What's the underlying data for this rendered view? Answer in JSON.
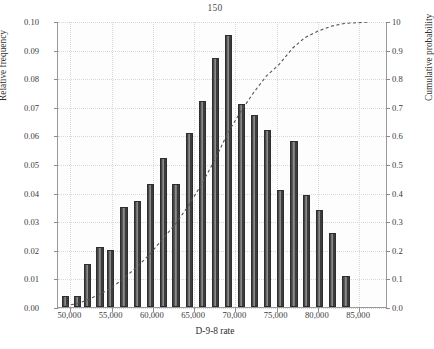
{
  "chart_data": {
    "type": "bar",
    "title": "150",
    "xlabel": "D-9-8 rate",
    "ylabel": "Relative frequency",
    "y2label": "Cumulative probability",
    "grid": true,
    "legend": "none",
    "xlim": [
      48500,
      88500
    ],
    "ylim": [
      0.0,
      0.1
    ],
    "y2lim": [
      0.0,
      1.0
    ],
    "ytick_labels": [
      "0.00",
      "0.01",
      "0.02",
      "0.03",
      "0.04",
      "0.05",
      "0.06",
      "0.07",
      "0.08",
      "0.09",
      "0.10"
    ],
    "ytick_values": [
      0.0,
      0.01,
      0.02,
      0.03,
      0.04,
      0.05,
      0.06,
      0.07,
      0.08,
      0.09,
      0.1
    ],
    "y2tick_labels": [
      "0.0",
      "0.1",
      "0.2",
      "0.3",
      "0.4",
      "0.5",
      "0.6",
      "0.7",
      "0.8",
      "0.9",
      "10"
    ],
    "y2tick_values": [
      0.0,
      0.1,
      0.2,
      0.3,
      0.4,
      0.5,
      0.6,
      0.7,
      0.8,
      0.9,
      1.0
    ],
    "xtick_labels": [
      "50,000",
      "55,000",
      "60,000",
      "65,000",
      "70,000",
      "75,000",
      "80,000",
      "85,000"
    ],
    "xtick_values": [
      50000,
      55000,
      60000,
      65000,
      70000,
      75000,
      80000,
      85000
    ],
    "bar_color": "#4a4a4a",
    "bar_edge_color": "#2e2e2e",
    "curve_color": "#555555",
    "curve_style": "dashed",
    "bar_centers": [
      49400,
      50900,
      52100,
      53600,
      54900,
      56200,
      57600,
      58900,
      60300,
      61600,
      62900,
      64300,
      65600,
      66900,
      68300,
      69600,
      70900,
      72300,
      73600,
      74900,
      76300,
      77600,
      79000,
      80300,
      81600,
      83000,
      84300,
      85600,
      87500
    ],
    "values": [
      0.004,
      0.004,
      0.015,
      0.021,
      0.02,
      0.035,
      0.037,
      0.043,
      0.052,
      0.043,
      0.061,
      0.072,
      0.087,
      0.095,
      0.071,
      0.067,
      0.062,
      0.041,
      0.058,
      0.039,
      0.034,
      0.026,
      0.011
    ],
    "categories": [
      "49,400",
      "50,900",
      "52,100",
      "53,600",
      "54,900",
      "56,200",
      "57,600",
      "58,900",
      "60,300",
      "61,600",
      "62,900",
      "64,300",
      "65,600",
      "66,900",
      "68,300",
      "69,600",
      "70,900",
      "72,300",
      "73,600",
      "74,900",
      "76,300",
      "77,600",
      "79,000"
    ],
    "series": [
      {
        "name": "Relative frequency",
        "type": "bar",
        "axis": "left",
        "points": [
          {
            "x": 49400,
            "y": 0.004
          },
          {
            "x": 50900,
            "y": 0.004
          },
          {
            "x": 52100,
            "y": 0.015
          },
          {
            "x": 53600,
            "y": 0.021
          },
          {
            "x": 54900,
            "y": 0.02
          },
          {
            "x": 56500,
            "y": 0.035
          },
          {
            "x": 58100,
            "y": 0.037
          },
          {
            "x": 59700,
            "y": 0.043
          },
          {
            "x": 61300,
            "y": 0.052
          },
          {
            "x": 62800,
            "y": 0.043
          },
          {
            "x": 64400,
            "y": 0.061
          },
          {
            "x": 66000,
            "y": 0.072
          },
          {
            "x": 67600,
            "y": 0.087
          },
          {
            "x": 69200,
            "y": 0.095
          },
          {
            "x": 70700,
            "y": 0.071
          },
          {
            "x": 72300,
            "y": 0.067
          },
          {
            "x": 73900,
            "y": 0.062
          },
          {
            "x": 75500,
            "y": 0.041
          },
          {
            "x": 77100,
            "y": 0.058
          },
          {
            "x": 78600,
            "y": 0.039
          },
          {
            "x": 80200,
            "y": 0.034
          },
          {
            "x": 81800,
            "y": 0.026
          },
          {
            "x": 83400,
            "y": 0.011
          }
        ]
      },
      {
        "name": "Cumulative probability",
        "type": "line",
        "axis": "right",
        "points": [
          {
            "x": 49400,
            "y": 0.005
          },
          {
            "x": 50900,
            "y": 0.012
          },
          {
            "x": 52100,
            "y": 0.025
          },
          {
            "x": 53600,
            "y": 0.045
          },
          {
            "x": 54900,
            "y": 0.065
          },
          {
            "x": 56500,
            "y": 0.1
          },
          {
            "x": 58100,
            "y": 0.14
          },
          {
            "x": 59700,
            "y": 0.185
          },
          {
            "x": 61300,
            "y": 0.24
          },
          {
            "x": 62800,
            "y": 0.29
          },
          {
            "x": 64400,
            "y": 0.355
          },
          {
            "x": 66000,
            "y": 0.43
          },
          {
            "x": 67600,
            "y": 0.515
          },
          {
            "x": 69200,
            "y": 0.61
          },
          {
            "x": 70700,
            "y": 0.682
          },
          {
            "x": 72300,
            "y": 0.75
          },
          {
            "x": 73900,
            "y": 0.81
          },
          {
            "x": 75500,
            "y": 0.852
          },
          {
            "x": 77100,
            "y": 0.908
          },
          {
            "x": 78600,
            "y": 0.945
          },
          {
            "x": 80200,
            "y": 0.968
          },
          {
            "x": 81800,
            "y": 0.985
          },
          {
            "x": 83400,
            "y": 0.995
          },
          {
            "x": 86500,
            "y": 1.0
          }
        ]
      }
    ]
  }
}
